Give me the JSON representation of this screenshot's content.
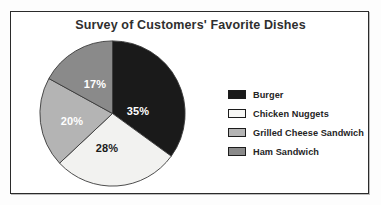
{
  "figure": {
    "title": "Survey of Customers' Favorite Dishes",
    "background": "#ffffff",
    "frame_color": "#2b2b2b"
  },
  "chart_data": {
    "type": "pie",
    "title": "Survey of Customers' Favorite Dishes",
    "xlabel": "",
    "ylabel": "",
    "start_angle_oclock": 12,
    "direction": "clockwise",
    "labels_on_slices": true,
    "legend_position": "right",
    "grid": false,
    "categories": [
      "Burger",
      "Chicken Nuggets",
      "Grilled Cheese Sandwich",
      "Ham Sandwich"
    ],
    "values": [
      35,
      28,
      20,
      17
    ],
    "value_labels": [
      "35%",
      "28%",
      "20%",
      "17%"
    ],
    "units": "percent",
    "total": 100,
    "colors": [
      "#1a1a1a",
      "#f2f2f0",
      "#b4b4b4",
      "#8a8a8a"
    ],
    "label_text_colors": [
      "#ffffff",
      "#1a1a1a",
      "#ffffff",
      "#ffffff"
    ],
    "slices": [
      {
        "name": "Burger",
        "value": 35,
        "label": "35%",
        "color": "#1a1a1a",
        "label_color": "#ffffff",
        "start_deg": 0,
        "end_deg": 126,
        "label_x": 99,
        "label_y": 72
      },
      {
        "name": "Chicken Nuggets",
        "value": 28,
        "label": "28%",
        "color": "#f2f2f0",
        "label_color": "#1a1a1a",
        "start_deg": 126,
        "end_deg": 226.8,
        "label_x": 68,
        "label_y": 109
      },
      {
        "name": "Grilled Cheese Sandwich",
        "value": 20,
        "label": "20%",
        "color": "#b4b4b4",
        "label_color": "#ffffff",
        "start_deg": 226.8,
        "end_deg": 298.8,
        "label_x": 33,
        "label_y": 82
      },
      {
        "name": "Ham Sandwich",
        "value": 17,
        "label": "17%",
        "color": "#8a8a8a",
        "label_color": "#ffffff",
        "start_deg": 298.8,
        "end_deg": 360,
        "label_x": 56,
        "label_y": 45
      }
    ]
  },
  "legend": {
    "items": [
      {
        "label": "Burger",
        "color": "#1a1a1a"
      },
      {
        "label": "Chicken Nuggets",
        "color": "#f7f7f5"
      },
      {
        "label": "Grilled Cheese Sandwich",
        "color": "#b4b4b4"
      },
      {
        "label": "Ham Sandwich",
        "color": "#8a8a8a"
      }
    ]
  }
}
